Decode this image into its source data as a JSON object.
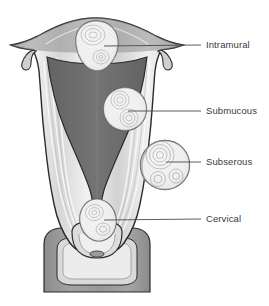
{
  "figure": {
    "background_color": "#ffffff"
  },
  "palette": {
    "outline": "#2b2b2b",
    "serosa": "#8f8f8f",
    "myometrium_light": "#e4e4e4",
    "myometrium_fiber": "#f7f7f7",
    "myometrium_mid": "#cdcdcd",
    "endometrial_cavity": "#6f6f6f",
    "cavity_dark": "#5d5d5d",
    "vaginal_wall": "#9a9a9a",
    "vaginal_wall_dark": "#8a8a8a",
    "fibroid_fill": "#f2f2f2",
    "fibroid_rim": "#707070",
    "fibroid_whorl": "#9b9b9b",
    "leader_line": "#4a4a4a",
    "label_text": "#3a3a3a"
  },
  "labels": [
    {
      "id": "intramural",
      "text": "Intramural",
      "x": 206,
      "y": 40,
      "leader": {
        "x1": 104,
        "y1": 46,
        "x2": 201,
        "y2": 45
      }
    },
    {
      "id": "submucous",
      "text": "Submucous",
      "x": 206,
      "y": 106,
      "leader": {
        "x1": 128,
        "y1": 111,
        "x2": 201,
        "y2": 111
      }
    },
    {
      "id": "subserous",
      "text": "Subserous",
      "x": 206,
      "y": 157,
      "leader": {
        "x1": 166,
        "y1": 162,
        "x2": 201,
        "y2": 162
      }
    },
    {
      "id": "cervical",
      "text": "Cervical",
      "x": 206,
      "y": 214,
      "leader": {
        "x1": 104,
        "y1": 220,
        "x2": 201,
        "y2": 219
      }
    }
  ],
  "fibroids": [
    {
      "id": "intramural",
      "label": "Intramural",
      "center_x": 96,
      "center_y": 45,
      "radius_x": 22,
      "radius_y": 24,
      "location": "fundus wall"
    },
    {
      "id": "submucous",
      "label": "Submucous",
      "center_x": 125,
      "center_y": 109,
      "radius_x": 21,
      "radius_y": 22,
      "location": "beneath endometrium"
    },
    {
      "id": "subserous",
      "label": "Subserous",
      "center_x": 165,
      "center_y": 165,
      "radius_x": 24,
      "radius_y": 25,
      "location": "outer serosal surface"
    },
    {
      "id": "cervical",
      "label": "Cervical",
      "center_x": 98,
      "center_y": 220,
      "radius_x": 18,
      "radius_y": 21,
      "location": "cervix"
    }
  ],
  "anatomy_parts": [
    {
      "id": "uterine-body",
      "name": "Uterine body / myometrium"
    },
    {
      "id": "uterine-fundus",
      "name": "Uterine fundus"
    },
    {
      "id": "endometrial-cavity",
      "name": "Endometrial cavity"
    },
    {
      "id": "fallopian-tube-left",
      "name": "Left fallopian tube / cornu"
    },
    {
      "id": "fallopian-tube-right",
      "name": "Right fallopian tube / cornu"
    },
    {
      "id": "cervix",
      "name": "Cervix"
    },
    {
      "id": "cervical-canal",
      "name": "Cervical canal"
    },
    {
      "id": "vaginal-wall",
      "name": "Vaginal wall"
    },
    {
      "id": "vaginal-fornix",
      "name": "Vaginal fornix"
    }
  ]
}
